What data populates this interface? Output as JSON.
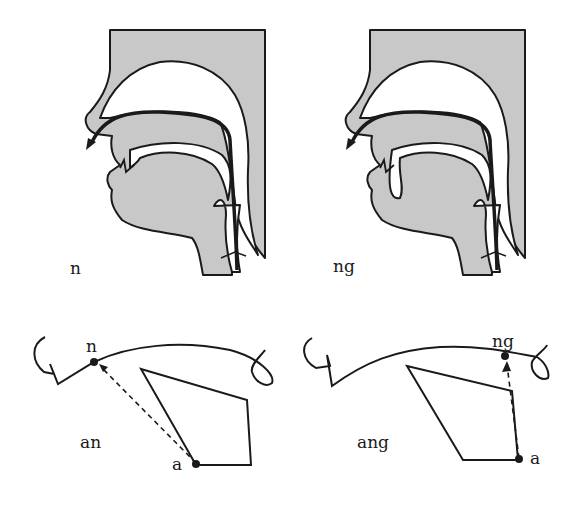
{
  "colors": {
    "tissue": "#c8c8c8",
    "stroke": "#1a1a1a",
    "background": "#ffffff"
  },
  "panels": {
    "top_left": {
      "label": "n",
      "description": "sagittal section, tongue tip raised to alveolar ridge, nasal airflow"
    },
    "top_right": {
      "label": "ng",
      "description": "sagittal section, tongue back raised to velum, nasal airflow"
    },
    "bottom_left": {
      "syllable": "an",
      "start_label": "a",
      "end_label": "n",
      "description": "tongue movement from vowel a to alveolar n"
    },
    "bottom_right": {
      "syllable": "ang",
      "start_label": "a",
      "end_label": "ng",
      "description": "tongue movement from vowel a to velar ng"
    }
  }
}
